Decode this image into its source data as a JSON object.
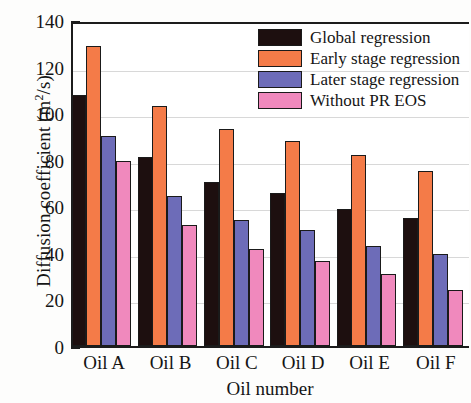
{
  "chart_data": {
    "type": "bar",
    "title": "",
    "xlabel": "Oil number",
    "ylabel": "Diffusion coefficient (m2/s)",
    "ylabel_main": "Diffusion coefficient (m",
    "ylabel_sup": "2",
    "ylabel_tail": "/s)",
    "categories": [
      "Oil A",
      "Oil B",
      "Oil C",
      "Oil D",
      "Oil E",
      "Oil F"
    ],
    "series": [
      {
        "name": "Global regression",
        "color": "#1d0f0f",
        "values": [
          108,
          81,
          70.5,
          65.5,
          59,
          55
        ]
      },
      {
        "name": "Early stage regression",
        "color": "#f47b48",
        "values": [
          129,
          103,
          93,
          88,
          82,
          75
        ]
      },
      {
        "name": "Later stage regression",
        "color": "#6d6cb8",
        "values": [
          90,
          64.5,
          54,
          50,
          43,
          39.5
        ]
      },
      {
        "name": "Without PR EOS",
        "color": "#f089bd",
        "values": [
          79.5,
          52,
          41.5,
          36.5,
          31,
          24
        ]
      }
    ],
    "ylim": [
      0,
      140
    ],
    "ytick_labels": [
      "0",
      "20",
      "40",
      "60",
      "80",
      "100",
      "120",
      "140"
    ],
    "ytick_values": [
      0,
      20,
      40,
      60,
      80,
      100,
      120,
      140
    ],
    "yminor_values": [
      10,
      30,
      50,
      70,
      90,
      110,
      130
    ],
    "grid": true,
    "grid_axis": "y",
    "legend_position": "top-right"
  },
  "legend": {
    "entries": [
      {
        "label": "Global regression",
        "color": "#1d0f0f"
      },
      {
        "label": "Early stage regression",
        "color": "#f47b48"
      },
      {
        "label": "Later stage regression",
        "color": "#6d6cb8"
      },
      {
        "label": "Without PR EOS",
        "color": "#f089bd"
      }
    ]
  }
}
